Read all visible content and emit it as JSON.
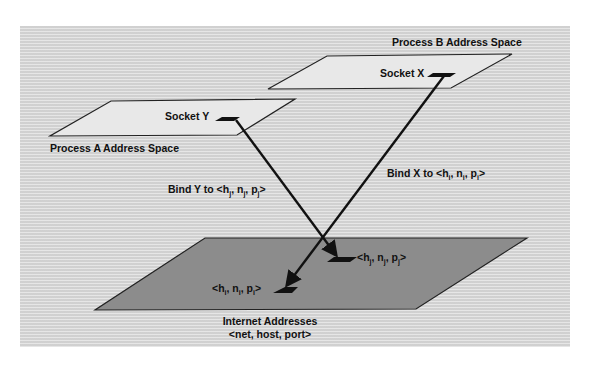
{
  "diagram": {
    "process_b": {
      "label": "Process B Address Space",
      "socket": "Socket X"
    },
    "process_a": {
      "label": "Process A Address Space",
      "socket": "Socket Y"
    },
    "bind_x": {
      "prefix": "Bind X to <",
      "h": "h",
      "n": "n",
      "p": "p",
      "sub": "i",
      "suffix": ">"
    },
    "bind_y": {
      "prefix": "Bind Y to <",
      "h": "h",
      "n": "n",
      "p": "p",
      "sub": "j",
      "suffix": ">"
    },
    "addr_j": {
      "prefix": "<",
      "h": "h",
      "n": "n",
      "p": "p",
      "sub": "j",
      "suffix": ">"
    },
    "addr_i": {
      "prefix": "<",
      "h": "h",
      "n": "n",
      "p": "p",
      "sub": "i",
      "suffix": ">"
    },
    "internet": {
      "title": "Internet Addresses",
      "format": "<net, host, port>"
    },
    "colors": {
      "panel": "#d9d9d9",
      "light_plane": "#e8e8e8",
      "dark_plane": "#8c8c8c",
      "stroke": "#111111"
    }
  }
}
